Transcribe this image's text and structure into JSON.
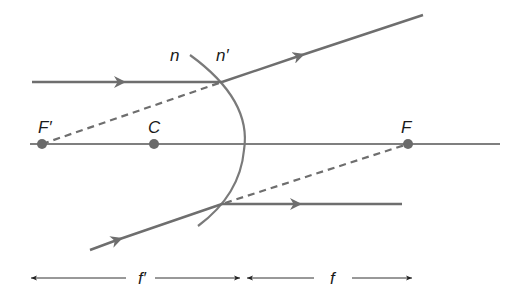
{
  "diagram": {
    "colors": {
      "ray": "#6e6e6e",
      "axis": "#555555",
      "surface": "#7a7a7a",
      "point": "#6a6a6a",
      "text": "#1a1a1a",
      "dimension": "#333333"
    },
    "labels": {
      "n": "n",
      "n_prime": "n′",
      "F_prime": "F′",
      "C": "C",
      "F": "F",
      "f_prime": "f′",
      "f": "f"
    },
    "points": [
      {
        "id": "F_prime",
        "label": "F′",
        "x": 42,
        "y": 144
      },
      {
        "id": "C",
        "label": "C",
        "x": 154,
        "y": 144
      },
      {
        "id": "F",
        "label": "F",
        "x": 408,
        "y": 144
      }
    ],
    "surface": {
      "top": [
        190,
        55
      ],
      "vertex": [
        245,
        144
      ],
      "bottom": [
        198,
        226
      ]
    },
    "rays": [
      {
        "id": "upper-incident",
        "from": [
          32,
          82
        ],
        "to": [
          222,
          82
        ],
        "style": "solid",
        "arrow": true
      },
      {
        "id": "upper-refracted",
        "from": [
          222,
          82
        ],
        "to": [
          423,
          15
        ],
        "style": "solid",
        "arrow": true
      },
      {
        "id": "upper-virtual",
        "from": [
          42,
          144
        ],
        "to": [
          222,
          82
        ],
        "style": "dashed"
      },
      {
        "id": "lower-incident",
        "from": [
          90,
          250
        ],
        "to": [
          222,
          204
        ],
        "style": "solid",
        "arrow": true
      },
      {
        "id": "lower-refracted",
        "from": [
          222,
          204
        ],
        "to": [
          402,
          204
        ],
        "style": "solid",
        "arrow": true
      },
      {
        "id": "lower-virtual",
        "from": [
          222,
          204
        ],
        "to": [
          408,
          144
        ],
        "style": "dashed"
      }
    ],
    "dimensions": [
      {
        "label": "f′",
        "from_x": 30,
        "to_x": 240,
        "y": 278
      },
      {
        "label": "f",
        "from_x": 247,
        "to_x": 412,
        "y": 278
      }
    ]
  }
}
